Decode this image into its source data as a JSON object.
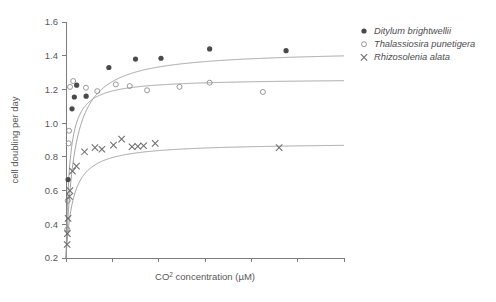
{
  "chart_data": {
    "type": "scatter",
    "title": "",
    "xlabel": "CO2 concentration (µM)",
    "xlabel_base": "CO",
    "xlabel_sup": "2",
    "xlabel_rest": " concentration (µM)",
    "ylabel": "cell doubling per day",
    "xlim": [
      0,
      120
    ],
    "ylim": [
      0.2,
      1.6
    ],
    "xticks": [
      0,
      20,
      40,
      60,
      80,
      100
    ],
    "xtick_labels": [
      "",
      "",
      "",
      "",
      "",
      ""
    ],
    "yticks": [
      0.2,
      0.4,
      0.6,
      0.8,
      1.0,
      1.2,
      1.4,
      1.6
    ],
    "ytick_labels": [
      "0.2",
      "0.4",
      "0.6",
      "0.8",
      "1.0",
      "1.2",
      "1.4",
      "1.6"
    ],
    "grid": false,
    "legend_position": "top-right",
    "series": [
      {
        "name": "Ditylum brightwellii",
        "marker": "filled-circle",
        "color": "#4a4a4c",
        "curve_vmax": 1.435,
        "curve_km": 3.6,
        "curve_base": 0.2,
        "points": [
          {
            "x": 0.9,
            "y": 0.665
          },
          {
            "x": 2.6,
            "y": 1.085
          },
          {
            "x": 3.6,
            "y": 1.155
          },
          {
            "x": 4.6,
            "y": 1.225
          },
          {
            "x": 8.7,
            "y": 1.16
          },
          {
            "x": 18.5,
            "y": 1.33
          },
          {
            "x": 30.0,
            "y": 1.38
          },
          {
            "x": 41.0,
            "y": 1.385
          },
          {
            "x": 62.0,
            "y": 1.44
          },
          {
            "x": 95.0,
            "y": 1.43
          }
        ]
      },
      {
        "name": "Thalassiosira punetigera",
        "marker": "open-circle",
        "color": "#8d8d8f",
        "curve_vmax": 1.265,
        "curve_km": 1.5,
        "curve_base": 0.2,
        "points": [
          {
            "x": 0.55,
            "y": 0.37
          },
          {
            "x": 0.75,
            "y": 0.54
          },
          {
            "x": 1.15,
            "y": 0.88
          },
          {
            "x": 1.35,
            "y": 0.955
          },
          {
            "x": 1.75,
            "y": 1.215
          },
          {
            "x": 3.1,
            "y": 1.25
          },
          {
            "x": 8.6,
            "y": 1.21
          },
          {
            "x": 13.5,
            "y": 1.19
          },
          {
            "x": 21.5,
            "y": 1.23
          },
          {
            "x": 27.5,
            "y": 1.22
          },
          {
            "x": 35.0,
            "y": 1.195
          },
          {
            "x": 49.0,
            "y": 1.215
          },
          {
            "x": 62.0,
            "y": 1.24
          },
          {
            "x": 85.0,
            "y": 1.185
          }
        ]
      },
      {
        "name": "Rhizosolenia alata",
        "marker": "cross",
        "color": "#6d6d6f",
        "curve_vmax": 0.885,
        "curve_km": 3.0,
        "curve_base": 0.2,
        "points": [
          {
            "x": 0.5,
            "y": 0.28
          },
          {
            "x": 0.6,
            "y": 0.345
          },
          {
            "x": 0.9,
            "y": 0.435
          },
          {
            "x": 1.5,
            "y": 0.565
          },
          {
            "x": 1.7,
            "y": 0.6
          },
          {
            "x": 2.8,
            "y": 0.715
          },
          {
            "x": 4.5,
            "y": 0.745
          },
          {
            "x": 8.0,
            "y": 0.83
          },
          {
            "x": 12.5,
            "y": 0.855
          },
          {
            "x": 15.5,
            "y": 0.845
          },
          {
            "x": 20.5,
            "y": 0.87
          },
          {
            "x": 24.0,
            "y": 0.905
          },
          {
            "x": 28.5,
            "y": 0.86
          },
          {
            "x": 31.0,
            "y": 0.862
          },
          {
            "x": 33.5,
            "y": 0.866
          },
          {
            "x": 38.5,
            "y": 0.88
          },
          {
            "x": 92.0,
            "y": 0.855
          }
        ]
      }
    ]
  },
  "legend": {
    "entries": [
      {
        "label": "Ditylum brightwellii",
        "marker": "filled-circle"
      },
      {
        "label": "Thalassiosira punetigera",
        "marker": "open-circle"
      },
      {
        "label": "Rhizosolenia alata",
        "marker": "cross"
      }
    ]
  }
}
